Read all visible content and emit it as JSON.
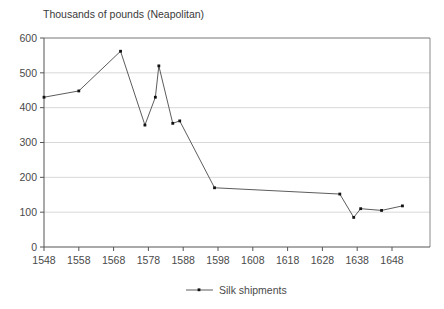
{
  "chart_data": {
    "type": "line",
    "title": "Thousands of pounds (Neapolitan)",
    "xlabel": "",
    "ylabel": "",
    "xlim": [
      1548,
      1651
    ],
    "ylim": [
      0,
      600
    ],
    "grid": true,
    "legend_position": "bottom-center",
    "series": [
      {
        "name": "Silk shipments",
        "x": [
          1548,
          1558,
          1570,
          1577,
          1580,
          1581,
          1585,
          1587,
          1597,
          1633,
          1637,
          1639,
          1645,
          1651
        ],
        "values": [
          430,
          448,
          562,
          350,
          430,
          520,
          355,
          362,
          170,
          152,
          85,
          110,
          105,
          118
        ]
      }
    ],
    "x_ticks": [
      1548,
      1558,
      1568,
      1578,
      1588,
      1598,
      1608,
      1618,
      1628,
      1638,
      1648
    ],
    "x_tick_labels": [
      "1548",
      "1558",
      "1568",
      "1578",
      "1588",
      "1598",
      "1608",
      "1618",
      "1628",
      "1638",
      "1648"
    ],
    "y_ticks": [
      0,
      100,
      200,
      300,
      400,
      500,
      600
    ],
    "y_tick_labels": [
      "0",
      "100",
      "200",
      "300",
      "400",
      "500",
      "600"
    ],
    "legend": [
      {
        "label": "Silk shipments",
        "marker": "square",
        "color": "#4a4a4a"
      }
    ]
  },
  "colors": {
    "series": "#4a4a4a",
    "marker": "#111111",
    "grid": "#d8d8d8",
    "axis": "#555555",
    "frame": "#8a8a8a",
    "text": "#4a4a4a",
    "background": "#ffffff"
  }
}
